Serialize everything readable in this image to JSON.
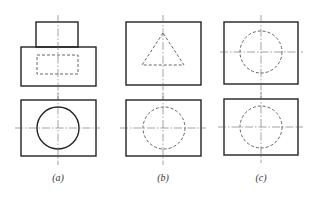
{
  "figure": {
    "panels": [
      {
        "id": "a",
        "label": "(a)",
        "top_view": "stepped-block-with-hidden-rectangle",
        "bottom_view": "rectangle-with-solid-circle"
      },
      {
        "id": "b",
        "label": "(b)",
        "top_view": "rectangle-with-hidden-triangle",
        "bottom_view": "rectangle-with-hidden-circle"
      },
      {
        "id": "c",
        "label": "(c)",
        "top_view": "rectangle-with-hidden-circle",
        "bottom_view": "rectangle-with-hidden-circle"
      }
    ],
    "colors": {
      "line": "#222222",
      "hidden": "#555555",
      "center": "#666666",
      "background": "#ffffff"
    }
  }
}
